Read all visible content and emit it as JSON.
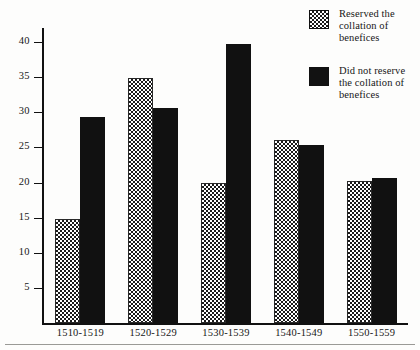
{
  "chart_data": {
    "type": "bar",
    "title": "",
    "xlabel": "",
    "ylabel": "",
    "grid": false,
    "legend_position": "top-right",
    "categories": [
      "1510-1519",
      "1520-1529",
      "1530-1539",
      "1540-1549",
      "1550-1559"
    ],
    "yticks": [
      5,
      10,
      15,
      20,
      25,
      30,
      35,
      40
    ],
    "ylim": [
      0,
      42
    ],
    "series": [
      {
        "name": "Reserved the collation of benefices",
        "pattern": "checkerboard",
        "color": "#1a1a1a",
        "values": [
          14.8,
          34.9,
          20.0,
          26.0,
          20.2
        ]
      },
      {
        "name": "Did not reserve the collation of benefices",
        "pattern": "solid",
        "color": "#111111",
        "values": [
          29.4,
          30.6,
          39.7,
          25.3,
          20.6
        ]
      }
    ]
  },
  "legend": {
    "items": [
      {
        "label": "Reserved the collation of benefices",
        "swatch": "dotted-swatch"
      },
      {
        "label": "Did not reserve the collation of benefices",
        "swatch": "solid-swatch"
      }
    ]
  },
  "axis": {
    "y_tick_labels": [
      "40",
      "35",
      "30",
      "25",
      "20",
      "15",
      "10",
      "5"
    ]
  }
}
